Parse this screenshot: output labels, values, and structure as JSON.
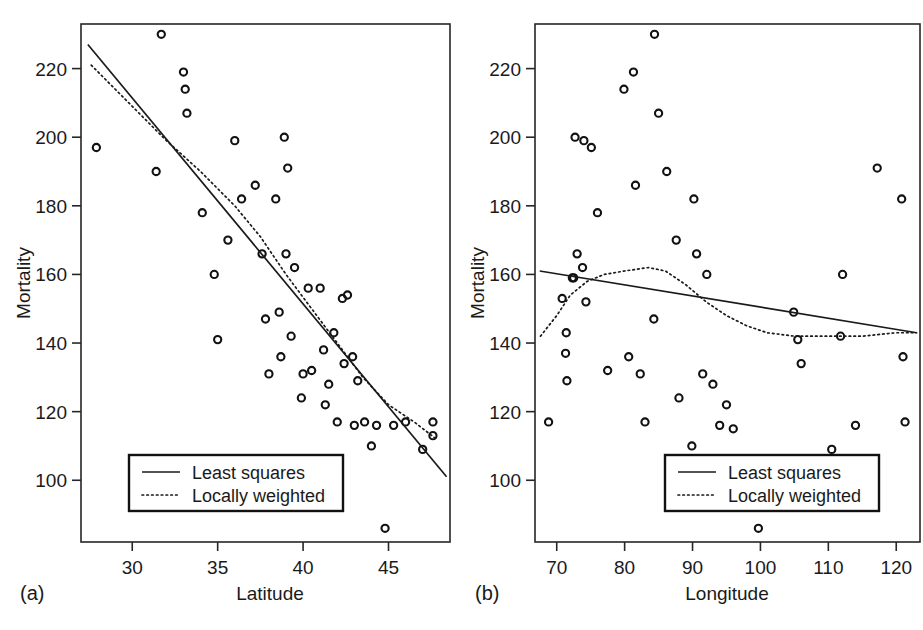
{
  "figure": {
    "panels": [
      {
        "caption": "(a)",
        "xlabel": "Latitude",
        "ylabel": "Mortality",
        "xticks": [
          30,
          35,
          40,
          45
        ],
        "yticks": [
          100,
          120,
          140,
          160,
          180,
          200,
          220
        ],
        "legend": {
          "solid": "Least squares",
          "dotted": "Locally weighted"
        }
      },
      {
        "caption": "(b)",
        "xlabel": "Longitude",
        "ylabel": "Mortality",
        "xticks": [
          70,
          80,
          90,
          100,
          110,
          120
        ],
        "yticks": [
          100,
          120,
          140,
          160,
          180,
          200,
          220
        ],
        "legend": {
          "solid": "Least squares",
          "dotted": "Locally weighted"
        }
      }
    ],
    "colors": {
      "ink": "#1a1a1a",
      "marker": "#111111",
      "background": "#ffffff"
    }
  },
  "chart_data": [
    {
      "type": "scatter",
      "panel": "(a)",
      "title": "",
      "xlabel": "Latitude",
      "ylabel": "Mortality",
      "xlim": [
        27.0,
        48.6
      ],
      "ylim": [
        82,
        233
      ],
      "xticks": [
        30,
        35,
        40,
        45
      ],
      "yticks": [
        100,
        120,
        140,
        160,
        180,
        200,
        220
      ],
      "grid": false,
      "legend_position": "bottom-left",
      "points": [
        {
          "x": 27.9,
          "y": 197
        },
        {
          "x": 31.4,
          "y": 190
        },
        {
          "x": 31.7,
          "y": 230
        },
        {
          "x": 33.0,
          "y": 219
        },
        {
          "x": 33.1,
          "y": 214
        },
        {
          "x": 33.2,
          "y": 207
        },
        {
          "x": 34.1,
          "y": 178
        },
        {
          "x": 34.8,
          "y": 160
        },
        {
          "x": 35.0,
          "y": 141
        },
        {
          "x": 35.6,
          "y": 170
        },
        {
          "x": 36.0,
          "y": 199
        },
        {
          "x": 36.4,
          "y": 182
        },
        {
          "x": 37.2,
          "y": 186
        },
        {
          "x": 37.6,
          "y": 166
        },
        {
          "x": 37.8,
          "y": 147
        },
        {
          "x": 38.0,
          "y": 131
        },
        {
          "x": 38.4,
          "y": 182
        },
        {
          "x": 38.6,
          "y": 149
        },
        {
          "x": 38.7,
          "y": 136
        },
        {
          "x": 38.9,
          "y": 200
        },
        {
          "x": 39.0,
          "y": 166
        },
        {
          "x": 39.1,
          "y": 191
        },
        {
          "x": 39.3,
          "y": 142
        },
        {
          "x": 39.5,
          "y": 162
        },
        {
          "x": 39.9,
          "y": 124
        },
        {
          "x": 40.0,
          "y": 131
        },
        {
          "x": 40.3,
          "y": 156
        },
        {
          "x": 40.5,
          "y": 132
        },
        {
          "x": 41.0,
          "y": 156
        },
        {
          "x": 41.2,
          "y": 138
        },
        {
          "x": 41.3,
          "y": 122
        },
        {
          "x": 41.5,
          "y": 128
        },
        {
          "x": 41.8,
          "y": 143
        },
        {
          "x": 42.0,
          "y": 117
        },
        {
          "x": 42.3,
          "y": 153
        },
        {
          "x": 42.4,
          "y": 134
        },
        {
          "x": 42.6,
          "y": 154
        },
        {
          "x": 42.9,
          "y": 136
        },
        {
          "x": 43.0,
          "y": 116
        },
        {
          "x": 43.2,
          "y": 129
        },
        {
          "x": 43.6,
          "y": 117
        },
        {
          "x": 44.0,
          "y": 110
        },
        {
          "x": 44.3,
          "y": 116
        },
        {
          "x": 44.8,
          "y": 86
        },
        {
          "x": 45.3,
          "y": 116
        },
        {
          "x": 46.0,
          "y": 117
        },
        {
          "x": 47.6,
          "y": 117
        },
        {
          "x": 47.6,
          "y": 113
        },
        {
          "x": 47.0,
          "y": 109
        }
      ],
      "series": [
        {
          "name": "Least squares",
          "style": "solid",
          "points": [
            {
              "x": 27.4,
              "y": 227
            },
            {
              "x": 48.4,
              "y": 101
            }
          ]
        },
        {
          "name": "Locally weighted",
          "style": "dotted",
          "points": [
            {
              "x": 27.6,
              "y": 221
            },
            {
              "x": 30.0,
              "y": 209
            },
            {
              "x": 32.0,
              "y": 199
            },
            {
              "x": 34.0,
              "y": 190
            },
            {
              "x": 36.0,
              "y": 180
            },
            {
              "x": 37.5,
              "y": 171
            },
            {
              "x": 39.0,
              "y": 160
            },
            {
              "x": 40.5,
              "y": 150
            },
            {
              "x": 42.0,
              "y": 140
            },
            {
              "x": 43.5,
              "y": 130
            },
            {
              "x": 45.0,
              "y": 122
            },
            {
              "x": 46.5,
              "y": 117
            },
            {
              "x": 47.8,
              "y": 112
            }
          ]
        }
      ]
    },
    {
      "type": "scatter",
      "panel": "(b)",
      "title": "",
      "xlabel": "Longitude",
      "ylabel": "Mortality",
      "xlim": [
        66.8,
        123.5
      ],
      "ylim": [
        82,
        233
      ],
      "xticks": [
        70,
        80,
        90,
        100,
        110,
        120
      ],
      "yticks": [
        100,
        120,
        140,
        160,
        180,
        200,
        220
      ],
      "grid": false,
      "legend_position": "bottom-center",
      "points": [
        {
          "x": 68.8,
          "y": 117
        },
        {
          "x": 70.8,
          "y": 153
        },
        {
          "x": 71.3,
          "y": 137
        },
        {
          "x": 71.4,
          "y": 143
        },
        {
          "x": 71.5,
          "y": 129
        },
        {
          "x": 72.3,
          "y": 159
        },
        {
          "x": 72.5,
          "y": 159
        },
        {
          "x": 72.7,
          "y": 200
        },
        {
          "x": 73.0,
          "y": 166
        },
        {
          "x": 73.8,
          "y": 162
        },
        {
          "x": 74.0,
          "y": 199
        },
        {
          "x": 74.3,
          "y": 152
        },
        {
          "x": 75.1,
          "y": 197
        },
        {
          "x": 76.0,
          "y": 178
        },
        {
          "x": 77.5,
          "y": 132
        },
        {
          "x": 79.9,
          "y": 214
        },
        {
          "x": 80.6,
          "y": 136
        },
        {
          "x": 81.3,
          "y": 219
        },
        {
          "x": 81.6,
          "y": 186
        },
        {
          "x": 82.3,
          "y": 131
        },
        {
          "x": 83.0,
          "y": 117
        },
        {
          "x": 84.3,
          "y": 147
        },
        {
          "x": 84.4,
          "y": 230
        },
        {
          "x": 85.0,
          "y": 207
        },
        {
          "x": 86.2,
          "y": 190
        },
        {
          "x": 87.6,
          "y": 170
        },
        {
          "x": 88.0,
          "y": 124
        },
        {
          "x": 89.9,
          "y": 110
        },
        {
          "x": 90.2,
          "y": 182
        },
        {
          "x": 90.6,
          "y": 166
        },
        {
          "x": 91.5,
          "y": 131
        },
        {
          "x": 92.1,
          "y": 160
        },
        {
          "x": 93.0,
          "y": 128
        },
        {
          "x": 94.0,
          "y": 116
        },
        {
          "x": 95.0,
          "y": 122
        },
        {
          "x": 96.0,
          "y": 115
        },
        {
          "x": 99.7,
          "y": 86
        },
        {
          "x": 104.9,
          "y": 149
        },
        {
          "x": 105.5,
          "y": 141
        },
        {
          "x": 106.0,
          "y": 134
        },
        {
          "x": 110.5,
          "y": 109
        },
        {
          "x": 111.8,
          "y": 142
        },
        {
          "x": 112.1,
          "y": 160
        },
        {
          "x": 114.0,
          "y": 116
        },
        {
          "x": 117.2,
          "y": 191
        },
        {
          "x": 120.8,
          "y": 182
        },
        {
          "x": 121.0,
          "y": 136
        },
        {
          "x": 121.3,
          "y": 117
        }
      ],
      "series": [
        {
          "name": "Least squares",
          "style": "solid",
          "points": [
            {
              "x": 67.5,
              "y": 161
            },
            {
              "x": 123.0,
              "y": 143
            }
          ]
        },
        {
          "name": "Locally weighted",
          "style": "dotted",
          "points": [
            {
              "x": 67.6,
              "y": 142
            },
            {
              "x": 70.0,
              "y": 148
            },
            {
              "x": 72.0,
              "y": 154
            },
            {
              "x": 74.5,
              "y": 158
            },
            {
              "x": 77.0,
              "y": 160
            },
            {
              "x": 80.0,
              "y": 161
            },
            {
              "x": 83.5,
              "y": 162
            },
            {
              "x": 86.0,
              "y": 161
            },
            {
              "x": 89.0,
              "y": 157
            },
            {
              "x": 92.0,
              "y": 152
            },
            {
              "x": 95.0,
              "y": 148
            },
            {
              "x": 98.0,
              "y": 145
            },
            {
              "x": 101.0,
              "y": 143
            },
            {
              "x": 105.0,
              "y": 142
            },
            {
              "x": 110.0,
              "y": 142
            },
            {
              "x": 115.0,
              "y": 142
            },
            {
              "x": 120.0,
              "y": 143
            },
            {
              "x": 123.0,
              "y": 143
            }
          ]
        }
      ]
    }
  ]
}
